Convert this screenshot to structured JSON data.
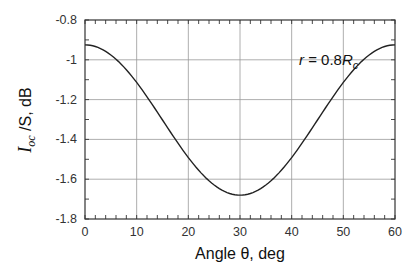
{
  "chart_data": {
    "type": "line",
    "title": "",
    "xlabel": "Angle θ, deg",
    "ylabel_parts": {
      "main": "I",
      "sub": "oc",
      "rest": " /S, dB"
    },
    "ylabel": "I_oc /S, dB",
    "xlim": [
      0,
      60
    ],
    "ylim": [
      -1.8,
      -0.8
    ],
    "x_ticks": [
      0,
      10,
      20,
      30,
      40,
      50,
      60
    ],
    "y_ticks": [
      -0.8,
      -1.0,
      -1.2,
      -1.4,
      -1.6,
      -1.8
    ],
    "x_tick_labels": [
      "0",
      "10",
      "20",
      "30",
      "40",
      "50",
      "60"
    ],
    "y_tick_labels": [
      "-0.8",
      "-1",
      "-1.2",
      "-1.4",
      "-1.6",
      "-1.8"
    ],
    "grid": true,
    "legend": null,
    "annotation": {
      "text_r": "r",
      "text_eq": " = 0.8",
      "text_R": "R",
      "text_sub": "c",
      "x": 42,
      "y": -1.0
    },
    "series": [
      {
        "name": "r = 0.8Rc",
        "color": "#222222",
        "x": [
          0,
          5,
          10,
          15,
          20,
          25,
          30,
          35,
          40,
          45,
          50,
          55,
          60
        ],
        "y": [
          -0.925,
          -0.975,
          -1.115,
          -1.3,
          -1.49,
          -1.63,
          -1.68,
          -1.63,
          -1.49,
          -1.3,
          -1.115,
          -0.975,
          -0.925
        ]
      }
    ]
  }
}
